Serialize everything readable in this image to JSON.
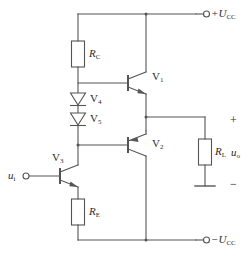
{
  "diagram": {
    "stroke_color": "#555555",
    "label_color": "#2b2b2b",
    "background": "#ffffff"
  },
  "supplies": {
    "positive": {
      "label": "+U",
      "sub": "CC",
      "terminal": "open-circle"
    },
    "negative": {
      "label": "−U",
      "sub": "CC",
      "terminal": "open-circle"
    }
  },
  "ports": {
    "input": {
      "label": "u",
      "sub": "i",
      "terminal": "open-circle"
    },
    "output": {
      "label": "u",
      "sub": "o"
    },
    "output_plus": "+",
    "output_minus": "−"
  },
  "resistors": [
    {
      "name": "R",
      "sub": "C",
      "id": "resistor-rc"
    },
    {
      "name": "R",
      "sub": "E",
      "id": "resistor-re"
    },
    {
      "name": "R",
      "sub": "L",
      "id": "resistor-rl"
    }
  ],
  "diodes": [
    {
      "name": "V",
      "sub": "4",
      "id": "diode-v4"
    },
    {
      "name": "V",
      "sub": "5",
      "id": "diode-v5"
    }
  ],
  "transistors": [
    {
      "name": "V",
      "sub": "1",
      "id": "transistor-v1",
      "type": "NPN"
    },
    {
      "name": "V",
      "sub": "2",
      "id": "transistor-v2",
      "type": "PNP"
    },
    {
      "name": "V",
      "sub": "3",
      "id": "transistor-v3",
      "type": "NPN"
    }
  ],
  "ground": {
    "id": "ground-symbol"
  }
}
